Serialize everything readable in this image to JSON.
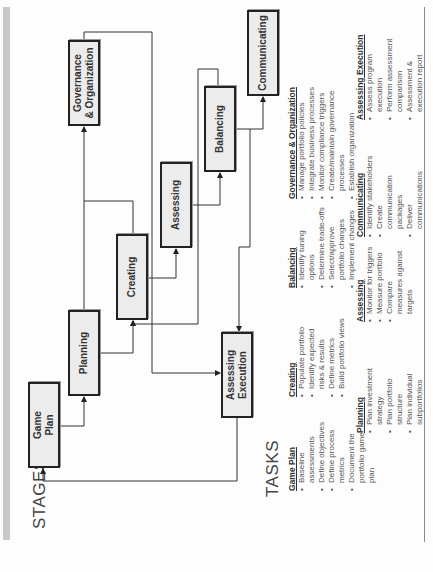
{
  "colors": {
    "box_fill": "#ececec",
    "box_border": "#222222",
    "line": "#333333",
    "gray_bar": "#c8c8c8",
    "text": "#555555"
  },
  "sections": {
    "stages_label": "STAGES",
    "tasks_label": "TASKS"
  },
  "stages": [
    {
      "id": "game-plan",
      "label": "Game\nPlan"
    },
    {
      "id": "planning",
      "label": "Planning"
    },
    {
      "id": "creating",
      "label": "Creating"
    },
    {
      "id": "assessing",
      "label": "Assessing"
    },
    {
      "id": "balancing",
      "label": "Balancing"
    },
    {
      "id": "communicating",
      "label": "Communicating"
    },
    {
      "id": "governance",
      "label": "Governance\n& Organization"
    },
    {
      "id": "assessing-execution",
      "label": "Assessing\nExecution"
    }
  ],
  "tasks": [
    {
      "title": "Game Plan",
      "items": [
        "Baseline assessments",
        "Define objectives",
        "Define process metrics",
        "Document the portfolio game plan"
      ]
    },
    {
      "title": "Planning",
      "items": [
        "Plan investment strategy",
        "Plan portfolio structure",
        "Plan individual subportfolios"
      ]
    },
    {
      "title": "Creating",
      "items": [
        "Populate portfolio",
        "Identify expected risks & results",
        "Define metrics",
        "Build portfolio views"
      ]
    },
    {
      "title": "Assessing",
      "items": [
        "Monitor for triggers",
        "Measure portfolio",
        "Compare measures against targets"
      ]
    },
    {
      "title": "Balancing",
      "items": [
        "Identify tuning options",
        "Determine trade-offs",
        "Select/approve portfolio changes",
        "Implement changes"
      ]
    },
    {
      "title": "Communicating",
      "items": [
        "Identify stakeholders",
        "Create communication packages",
        "Deliver communications"
      ]
    },
    {
      "title": "Governance & Organization",
      "items": [
        "Manage portfolio policies",
        "Integrate business processes",
        "Monitor compliance triggers",
        "Create/maintain governance processes",
        "Establish organization"
      ]
    },
    {
      "title": "Assessing Execution",
      "items": [
        "Assess program execution",
        "Perform assessment comparison",
        "Assessment & execution report"
      ]
    }
  ]
}
